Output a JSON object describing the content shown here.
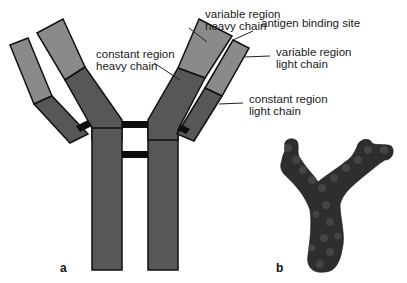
{
  "figure": {
    "panels": [
      {
        "id": "a",
        "label": "a",
        "description": "Schematic antibody (Y-shaped) with heavy and light chains"
      },
      {
        "id": "b",
        "label": "b",
        "description": "Space-filling molecular model of antibody"
      }
    ],
    "labels": {
      "variable_heavy": [
        "variable region",
        "heavy chain"
      ],
      "constant_heavy": [
        "constant region",
        "heavy chain"
      ],
      "antigen_site": [
        "antigen binding site"
      ],
      "variable_light": [
        "variable region",
        "light chain"
      ],
      "constant_light": [
        "constant region",
        "light chain"
      ]
    },
    "colors": {
      "variable": "#8a8a8a",
      "constant": "#575757",
      "outline": "#111111",
      "disulfide": "#0d0d0d",
      "model": "#2e2e2e"
    }
  }
}
